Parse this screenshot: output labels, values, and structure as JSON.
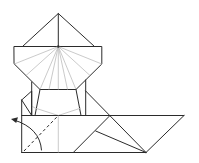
{
  "diagram": {
    "type": "origami-fold-step",
    "colors": {
      "line": "#2b2b2b",
      "crease": "#bdbdbd",
      "background": "#ffffff"
    },
    "annotations": [
      {
        "kind": "valley-fold-line",
        "style": "dashed"
      },
      {
        "kind": "fold-direction-arrow",
        "direction": "up-left"
      }
    ]
  }
}
